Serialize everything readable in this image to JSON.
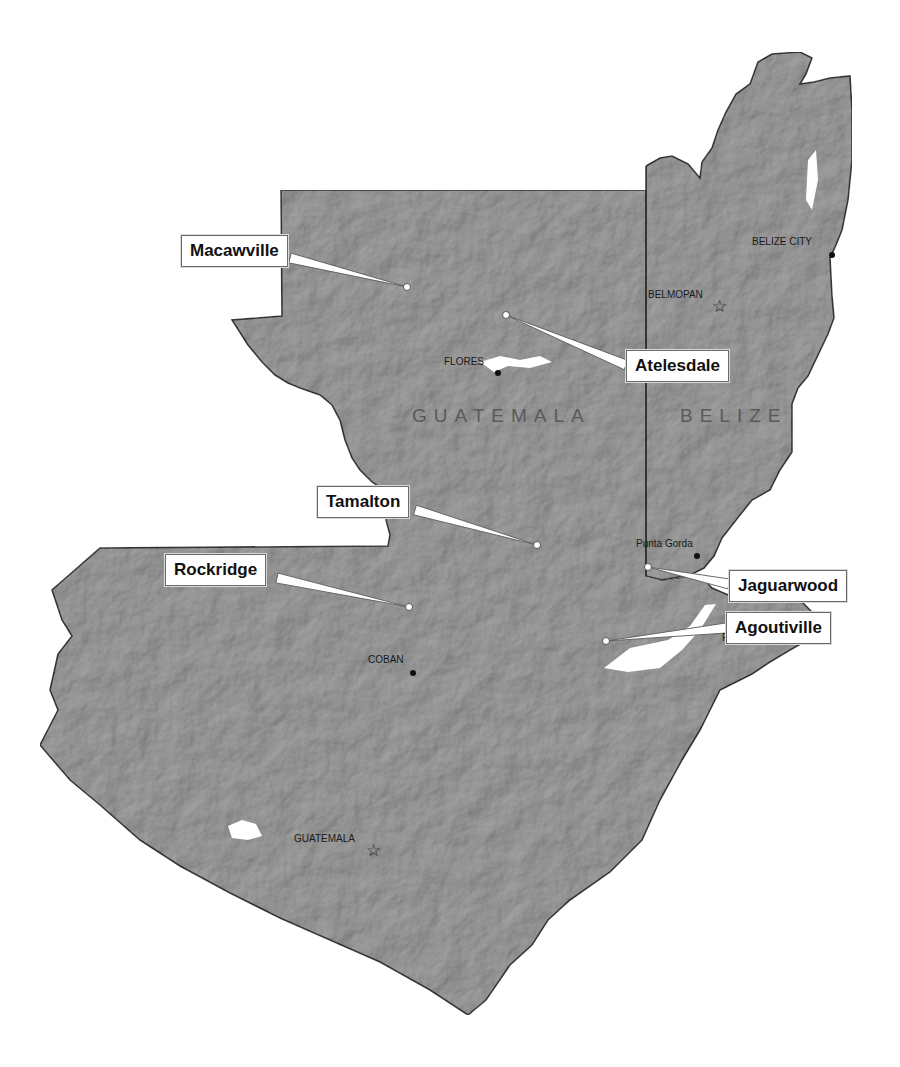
{
  "map": {
    "colors": {
      "land": "#a9a9a9",
      "land_dark": "#8f8f8f",
      "border": "#3c3c3c",
      "water": "#ffffff",
      "callout_border": "#6a6a6a",
      "marker_fill": "#ffffff",
      "city_dot": "#111111"
    },
    "countries": [
      {
        "name": "GUATEMALA",
        "x": 412,
        "y": 415
      },
      {
        "name": "BELIZE",
        "x": 680,
        "y": 415
      }
    ],
    "capitals": [
      {
        "name": "BELMOPAN",
        "x": 648,
        "y": 291,
        "marker_x": 720,
        "marker_y": 307,
        "symbol": "☆"
      },
      {
        "name": "GUATEMALA",
        "x": 294,
        "y": 833,
        "marker_x": 374,
        "marker_y": 851,
        "symbol": "☆"
      }
    ],
    "cities": [
      {
        "name": "BELIZE CITY",
        "x": 752,
        "y": 236,
        "dot_x": 832,
        "dot_y": 255
      },
      {
        "name": "FLORES",
        "x": 444,
        "y": 356,
        "dot_x": 498,
        "dot_y": 373
      },
      {
        "name": "Punta Gorda",
        "x": 636,
        "y": 538,
        "dot_x": 697,
        "dot_y": 556
      },
      {
        "name": "Puerto Barrios",
        "x": 723,
        "y": 633,
        "dot_x": 755,
        "dot_y": 626
      },
      {
        "name": "COBAN",
        "x": 368,
        "y": 655,
        "dot_x": 413,
        "dot_y": 673
      }
    ],
    "study_sites": [
      {
        "name": "Macawville",
        "box_x": 181,
        "box_y": 235,
        "point_x": 407,
        "point_y": 287,
        "anchor_x": 290,
        "anchor_y": 258
      },
      {
        "name": "Atelesdale",
        "box_x": 626,
        "box_y": 350,
        "point_x": 506,
        "point_y": 315,
        "anchor_x": 626,
        "anchor_y": 365
      },
      {
        "name": "Tamalton",
        "box_x": 317,
        "box_y": 486,
        "point_x": 537,
        "point_y": 545,
        "anchor_x": 415,
        "anchor_y": 510
      },
      {
        "name": "Rockridge",
        "box_x": 165,
        "box_y": 554,
        "point_x": 409,
        "point_y": 607,
        "anchor_x": 277,
        "anchor_y": 578
      },
      {
        "name": "Jaguarwood",
        "box_x": 729,
        "box_y": 570,
        "point_x": 648,
        "point_y": 567,
        "anchor_x": 729,
        "anchor_y": 584
      },
      {
        "name": "Agoutiville",
        "box_x": 726,
        "box_y": 612,
        "point_x": 606,
        "point_y": 641,
        "anchor_x": 726,
        "anchor_y": 628
      }
    ]
  }
}
